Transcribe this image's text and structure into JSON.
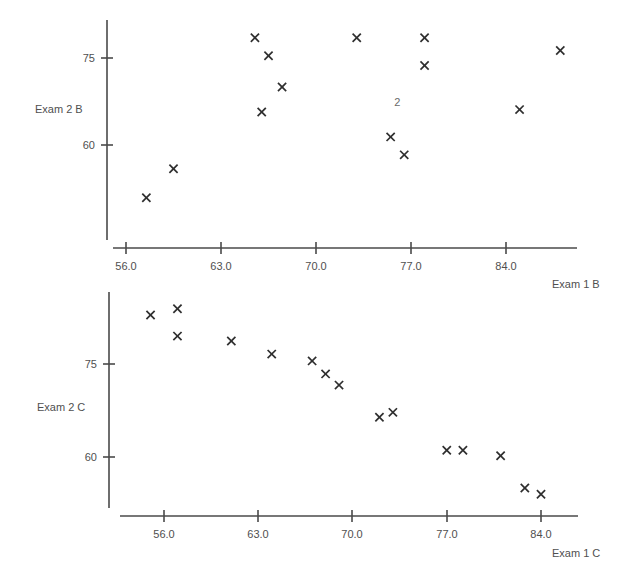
{
  "figure": {
    "background_color": "#ffffff",
    "marker_color": "#2e2e2e",
    "axis_color": "#4a4a4a",
    "text_color": "#4f4f4f",
    "marker_symbol": "x"
  },
  "chart_data": [
    {
      "type": "scatter",
      "title": "",
      "xlabel": "Exam 1 B",
      "ylabel": "Exam 2 B",
      "xticks": [
        "56.0",
        "63.0",
        "70.0",
        "77.0",
        "84.0"
      ],
      "xtick_values": [
        56.0,
        63.0,
        70.0,
        77.0,
        84.0
      ],
      "yticks": [
        "75",
        "60"
      ],
      "ytick_values": [
        75,
        60
      ],
      "xlim": [
        54.7,
        89.7
      ],
      "ylim": [
        47.5,
        81.0
      ],
      "grid": false,
      "legend": "none",
      "marker": "x",
      "points": [
        {
          "x": 57.5,
          "y": 50.9
        },
        {
          "x": 59.5,
          "y": 55.9
        },
        {
          "x": 65.5,
          "y": 78.5
        },
        {
          "x": 66.0,
          "y": 65.7
        },
        {
          "x": 66.5,
          "y": 75.4
        },
        {
          "x": 67.5,
          "y": 70.0
        },
        {
          "x": 73.0,
          "y": 78.5
        },
        {
          "x": 75.5,
          "y": 61.4
        },
        {
          "x": 76.5,
          "y": 58.3
        },
        {
          "x": 78.0,
          "y": 78.5
        },
        {
          "x": 78.0,
          "y": 73.7
        },
        {
          "x": 85.0,
          "y": 66.1
        },
        {
          "x": 88.0,
          "y": 76.3
        }
      ],
      "annotations": [
        {
          "text": "2",
          "x": 76.0,
          "y": 66.8
        }
      ]
    },
    {
      "type": "scatter",
      "title": "",
      "xlabel": "Exam 1 C",
      "ylabel": "Exam 2 C",
      "xticks": [
        "56.0",
        "63.0",
        "70.0",
        "77.0",
        "84.0"
      ],
      "xtick_values": [
        56.0,
        63.0,
        70.0,
        77.0,
        84.0
      ],
      "yticks": [
        "75",
        "60"
      ],
      "ytick_values": [
        75,
        60
      ],
      "xlim": [
        53.4,
        88.2
      ],
      "ylim": [
        51.4,
        86.0
      ],
      "grid": false,
      "legend": "none",
      "marker": "x",
      "points": [
        {
          "x": 55.0,
          "y": 82.9
        },
        {
          "x": 57.0,
          "y": 83.9
        },
        {
          "x": 57.0,
          "y": 79.5
        },
        {
          "x": 61.0,
          "y": 78.7
        },
        {
          "x": 64.0,
          "y": 76.6
        },
        {
          "x": 67.0,
          "y": 75.5
        },
        {
          "x": 68.0,
          "y": 73.4
        },
        {
          "x": 69.0,
          "y": 71.6
        },
        {
          "x": 72.0,
          "y": 66.4
        },
        {
          "x": 73.0,
          "y": 67.2
        },
        {
          "x": 77.0,
          "y": 61.1
        },
        {
          "x": 78.2,
          "y": 61.1
        },
        {
          "x": 81.0,
          "y": 60.2
        },
        {
          "x": 82.8,
          "y": 55.0
        },
        {
          "x": 84.0,
          "y": 54.0
        }
      ],
      "annotations": []
    }
  ]
}
